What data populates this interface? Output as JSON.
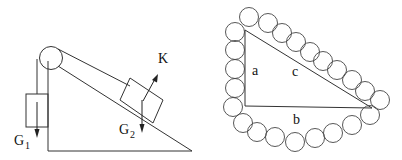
{
  "left_figure": {
    "description": "Inclined plane with pulley and two blocks",
    "labels": {
      "K": "K",
      "G1_main": "G",
      "G1_sub": "1",
      "G2_main": "G",
      "G2_sub": "2"
    }
  },
  "right_figure": {
    "description": "Right triangle surrounded by a chain of circles",
    "labels": {
      "a": "a",
      "b": "b",
      "c": "c"
    }
  },
  "colors": {
    "stroke": "#333333",
    "background": "#ffffff"
  }
}
